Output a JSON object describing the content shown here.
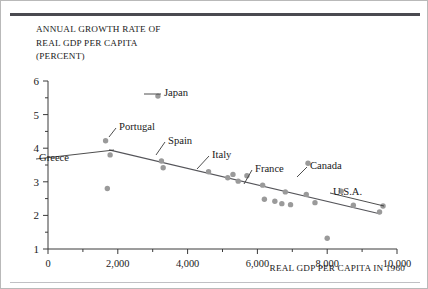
{
  "figure": {
    "y_axis_caption_lines": [
      "ANNUAL GROWTH RATE OF",
      "REAL GDP PER CAPITA",
      "(PERCENT)"
    ],
    "x_axis_title": "REAL GDP PER CAPITA IN 1960"
  },
  "chart_data": {
    "type": "scatter",
    "title": "",
    "xlabel": "REAL GDP PER CAPITA IN 1960",
    "ylabel": "ANNUAL GROWTH RATE OF REAL GDP PER CAPITA (PERCENT)",
    "xlim": [
      0,
      10000
    ],
    "ylim": [
      1,
      6
    ],
    "grid": false,
    "legend": "none",
    "x_ticks": [
      0,
      2000,
      4000,
      6000,
      8000,
      10000
    ],
    "x_tick_labels": [
      "0",
      "2,000",
      "4,000",
      "6,000",
      "8,000",
      "10,000"
    ],
    "x_minor_ticks": [
      1000,
      3000,
      5000,
      7000,
      9000
    ],
    "y_ticks": [
      1,
      2,
      3,
      4,
      5,
      6
    ],
    "y_tick_labels": [
      "1",
      "2",
      "3",
      "4",
      "5",
      "6"
    ],
    "y_minor_ticks": [
      1.5,
      2.5,
      3.5,
      4.5,
      5.5
    ],
    "marker_color": "#9a9a9a",
    "trendline": {
      "x": [
        1750,
        9500
      ],
      "y": [
        3.95,
        2.05
      ],
      "color": "#55555a"
    },
    "points": [
      {
        "x": 1650,
        "y": 4.22,
        "label": "Portugal"
      },
      {
        "x": 1780,
        "y": 3.8,
        "label": "Greece"
      },
      {
        "x": 1700,
        "y": 2.8,
        "label": ""
      },
      {
        "x": 3150,
        "y": 5.55,
        "label": "Japan"
      },
      {
        "x": 3250,
        "y": 3.62,
        "label": "Spain"
      },
      {
        "x": 3300,
        "y": 3.42,
        "label": ""
      },
      {
        "x": 4600,
        "y": 3.3,
        "label": "Italy"
      },
      {
        "x": 5150,
        "y": 3.12,
        "label": ""
      },
      {
        "x": 5300,
        "y": 3.22,
        "label": ""
      },
      {
        "x": 5450,
        "y": 3.02,
        "label": ""
      },
      {
        "x": 5700,
        "y": 3.18,
        "label": ""
      },
      {
        "x": 6150,
        "y": 2.9,
        "label": "France"
      },
      {
        "x": 6200,
        "y": 2.48,
        "label": ""
      },
      {
        "x": 6500,
        "y": 2.42,
        "label": ""
      },
      {
        "x": 6700,
        "y": 2.35,
        "label": ""
      },
      {
        "x": 6800,
        "y": 2.7,
        "label": ""
      },
      {
        "x": 6950,
        "y": 2.32,
        "label": ""
      },
      {
        "x": 7450,
        "y": 3.55,
        "label": "Canada"
      },
      {
        "x": 7400,
        "y": 2.62,
        "label": ""
      },
      {
        "x": 7650,
        "y": 2.38,
        "label": ""
      },
      {
        "x": 8000,
        "y": 1.32,
        "label": ""
      },
      {
        "x": 8400,
        "y": 2.72,
        "label": ""
      },
      {
        "x": 8750,
        "y": 2.3,
        "label": ""
      },
      {
        "x": 9600,
        "y": 2.28,
        "label": "U.S.A."
      },
      {
        "x": 9500,
        "y": 2.1,
        "label": ""
      }
    ],
    "annotations": [
      {
        "text": "Japan",
        "tx": 163,
        "ty": 91,
        "px": 143,
        "py": 93,
        "anchor": "left"
      },
      {
        "text": "Portugal",
        "tx": 118,
        "ty": 125,
        "px": 108,
        "py": 136,
        "anchor": "left"
      },
      {
        "text": "Greece",
        "tx": 38,
        "ty": 156,
        "px": 113,
        "py": 149,
        "anchor": "left"
      },
      {
        "text": "Spain",
        "tx": 167,
        "ty": 139,
        "px": 155,
        "py": 154,
        "anchor": "left"
      },
      {
        "text": "Italy",
        "tx": 211,
        "ty": 153,
        "px": 196,
        "py": 168,
        "anchor": "left"
      },
      {
        "text": "France",
        "tx": 254,
        "ty": 167,
        "px": 243,
        "py": 183,
        "anchor": "left"
      },
      {
        "text": "Canada",
        "tx": 309,
        "ty": 164,
        "px": 296,
        "py": 176,
        "anchor": "left"
      },
      {
        "text": "U.S.A.",
        "tx": 332,
        "ty": 190,
        "px": 383,
        "py": 205,
        "anchor": "left"
      }
    ]
  }
}
